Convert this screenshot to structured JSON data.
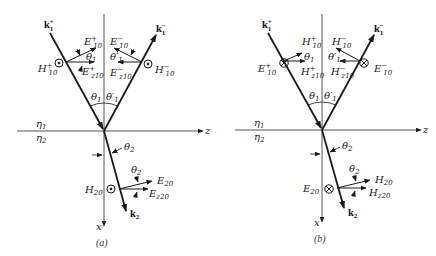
{
  "figure": {
    "panels": [
      {
        "id": "a",
        "caption": "(a)",
        "polarization": "H perpendicular to plane of incidence (dot out of page)",
        "labels": {
          "k_inc": "k",
          "k_inc_sup": "+",
          "k_inc_sub": "1",
          "k_ref": "k",
          "k_ref_sup": "−",
          "k_ref_sub": "1",
          "k_tr": "k",
          "k_tr_sub": "2",
          "inc_field": "E",
          "inc_field_sup": "+",
          "inc_field_sub": "10",
          "inc_z": "E",
          "inc_z_sup": "+",
          "inc_z_sub": "z10",
          "inc_perp": "H",
          "inc_perp_sup": "+",
          "inc_perp_sub": "10",
          "ref_field": "E",
          "ref_field_sup": "−",
          "ref_field_sub": "10",
          "ref_z": "E",
          "ref_z_sup": "−",
          "ref_z_sub": "z10",
          "ref_perp": "H",
          "ref_perp_sup": "−",
          "ref_perp_sub": "10",
          "tr_field": "E",
          "tr_field_sub": "20",
          "tr_z": "E",
          "tr_z_sub": "z20",
          "tr_perp": "H",
          "tr_perp_sub": "20",
          "perp_symbol": "dot"
        }
      },
      {
        "id": "b",
        "caption": "(b)",
        "polarization": "E perpendicular to plane of incidence (cross into page)",
        "labels": {
          "k_inc": "k",
          "k_inc_sup": "+",
          "k_inc_sub": "1",
          "k_ref": "k",
          "k_ref_sup": "−",
          "k_ref_sub": "1",
          "k_tr": "k",
          "k_tr_sub": "2",
          "inc_field": "H",
          "inc_field_sup": "+",
          "inc_field_sub": "10",
          "inc_z": "H",
          "inc_z_sup": "+",
          "inc_z_sub": "z10",
          "inc_perp": "E",
          "inc_perp_sup": "+",
          "inc_perp_sub": "10",
          "ref_field": "H",
          "ref_field_sup": "−",
          "ref_field_sub": "10",
          "ref_z": "H",
          "ref_z_sup": "−",
          "ref_z_sub": "z10",
          "ref_perp": "E",
          "ref_perp_sup": "−",
          "ref_perp_sub": "10",
          "tr_field": "H",
          "tr_field_sub": "20",
          "tr_z": "H",
          "tr_z_sub": "z20",
          "tr_perp": "E",
          "tr_perp_sub": "20",
          "perp_symbol": "cross"
        }
      }
    ],
    "common": {
      "theta1": "θ",
      "theta1_sub": "1",
      "theta1p": "θ′",
      "theta1p_sub": "1",
      "theta2": "θ",
      "theta2_sub": "2",
      "eta1": "η",
      "eta1_sub": "1",
      "eta2": "η",
      "eta2_sub": "2",
      "axis_z": "z",
      "axis_x": "x"
    },
    "colors": {
      "line": "#1a1a1a",
      "axis": "#555555",
      "background": "#ffffff"
    }
  }
}
